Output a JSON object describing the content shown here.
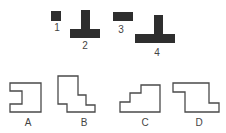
{
  "pieces": [
    {
      "label": "1"
    },
    {
      "label": "2"
    },
    {
      "label": "3"
    },
    {
      "label": "4"
    }
  ],
  "options": [
    {
      "label": "A"
    },
    {
      "label": "B"
    },
    {
      "label": "C"
    },
    {
      "label": "D"
    }
  ],
  "colors": {
    "piece": "#2e2e2e",
    "outline": "#4a4a4a",
    "background": "#ffffff"
  }
}
